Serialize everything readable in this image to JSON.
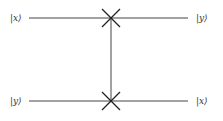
{
  "circuit": {
    "gate": "SWAP",
    "wires": [
      {
        "input_label": "|x⟩",
        "output_label": "|y⟩"
      },
      {
        "input_label": "|y⟩",
        "output_label": "|x⟩"
      }
    ],
    "icons": {
      "swap_marker": "x-cross-icon"
    }
  }
}
